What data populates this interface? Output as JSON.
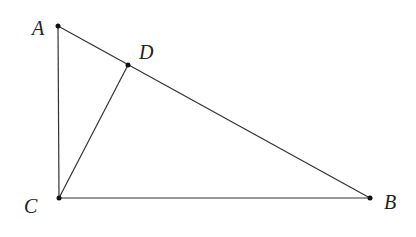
{
  "diagram": {
    "type": "triangle",
    "points": {
      "A": {
        "label": "A",
        "x": 58,
        "y": 26
      },
      "D": {
        "label": "D",
        "x": 128,
        "y": 65
      },
      "C": {
        "label": "C",
        "x": 59,
        "y": 198
      },
      "B": {
        "label": "B",
        "x": 370,
        "y": 198
      }
    },
    "segments": [
      [
        "A",
        "C"
      ],
      [
        "A",
        "B"
      ],
      [
        "C",
        "B"
      ],
      [
        "C",
        "D"
      ]
    ],
    "line_color": "#333333"
  }
}
